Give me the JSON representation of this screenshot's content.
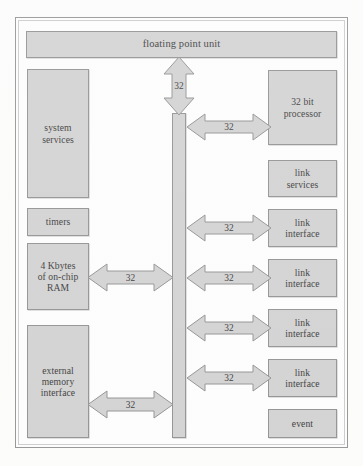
{
  "diagram": {
    "colors": {
      "box_fill": "#cfcfcf",
      "box_border": "#8a8a8a",
      "arrow_fill": "#cfcfcf",
      "arrow_border": "#8a8a8a",
      "frame_border": "#8d8d8d",
      "text": "#2b2b2b",
      "page_background": "#fcfcfb"
    },
    "top": {
      "fpu_label": "floating point unit"
    },
    "left_column": [
      {
        "id": "system-services",
        "label": "system\nservices"
      },
      {
        "id": "timers",
        "label": "timers"
      },
      {
        "id": "on-chip-ram",
        "label": "4 Kbytes\nof on-chip\nRAM"
      },
      {
        "id": "external-memory-interface",
        "label": "external\nmemory\ninterface"
      }
    ],
    "right_column": [
      {
        "id": "processor",
        "label": "32 bit\nprocessor"
      },
      {
        "id": "link-services",
        "label": "link\nservices"
      },
      {
        "id": "link-interface-1",
        "label": "link\ninterface"
      },
      {
        "id": "link-interface-2",
        "label": "link\ninterface"
      },
      {
        "id": "link-interface-3",
        "label": "link\ninterface"
      },
      {
        "id": "link-interface-4",
        "label": "link\ninterface"
      },
      {
        "id": "event",
        "label": "event"
      }
    ],
    "bus": {
      "id": "central-bus",
      "label": ""
    },
    "connections": [
      {
        "id": "bus-to-fpu",
        "orientation": "vertical",
        "label": "32",
        "from": "central-bus",
        "to": "floating point unit"
      },
      {
        "id": "bus-to-processor",
        "orientation": "horizontal",
        "label": "32",
        "from": "central-bus",
        "to": "32 bit processor"
      },
      {
        "id": "bus-to-link-interface-1",
        "orientation": "horizontal",
        "label": "32",
        "from": "central-bus",
        "to": "link interface"
      },
      {
        "id": "bus-to-link-interface-2",
        "orientation": "horizontal",
        "label": "32",
        "from": "central-bus",
        "to": "link interface"
      },
      {
        "id": "bus-to-link-interface-3",
        "orientation": "horizontal",
        "label": "32",
        "from": "central-bus",
        "to": "link interface"
      },
      {
        "id": "bus-to-link-interface-4",
        "orientation": "horizontal",
        "label": "32",
        "from": "central-bus",
        "to": "link interface"
      },
      {
        "id": "ram-to-bus",
        "orientation": "horizontal",
        "label": "32",
        "from": "4 Kbytes of on-chip RAM",
        "to": "central-bus"
      },
      {
        "id": "emi-to-bus",
        "orientation": "horizontal",
        "label": "32",
        "from": "external memory interface",
        "to": "central-bus"
      }
    ]
  }
}
